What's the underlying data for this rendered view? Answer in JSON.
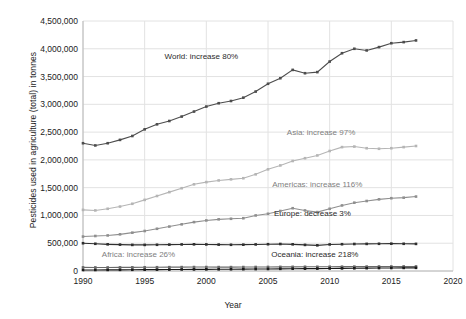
{
  "chart_data": {
    "type": "line",
    "title": "",
    "xlabel": "Year",
    "ylabel": "Pesticides used in agriculture (total) in tonnes",
    "xlim": [
      1990,
      2020
    ],
    "ylim": [
      0,
      4500000
    ],
    "grid": true,
    "legend_position": "inline-annotations",
    "x": [
      1990,
      1991,
      1992,
      1993,
      1994,
      1995,
      1996,
      1997,
      1998,
      1999,
      2000,
      2001,
      2002,
      2003,
      2004,
      2005,
      2006,
      2007,
      2008,
      2009,
      2010,
      2011,
      2012,
      2013,
      2014,
      2015,
      2016,
      2017
    ],
    "xticks": [
      "1990",
      "1995",
      "2000",
      "2005",
      "2010",
      "2015",
      "2020"
    ],
    "yticks": [
      "0",
      "500,000",
      "1,000,000",
      "1,500,000",
      "2,000,000",
      "2,500,000",
      "3,000,000",
      "3,500,000",
      "4,000,000",
      "4,500,000"
    ],
    "series": [
      {
        "name": "World",
        "annotation": "World: increase 80%",
        "color": "#4d4d4d",
        "annotation_x": 1999.6,
        "annotation_y": 3870000,
        "values": [
          2300000,
          2260000,
          2300000,
          2360000,
          2430000,
          2550000,
          2640000,
          2700000,
          2780000,
          2870000,
          2960000,
          3020000,
          3060000,
          3120000,
          3230000,
          3370000,
          3470000,
          3620000,
          3560000,
          3580000,
          3770000,
          3920000,
          4000000,
          3970000,
          4030000,
          4100000,
          4120000,
          4150000
        ]
      },
      {
        "name": "Asia",
        "annotation": "Asia: increase 97%",
        "color": "#b5b5b5",
        "annotation_x": 2009.3,
        "annotation_y": 2510000,
        "values": [
          1100000,
          1090000,
          1120000,
          1160000,
          1210000,
          1280000,
          1350000,
          1420000,
          1490000,
          1560000,
          1600000,
          1630000,
          1650000,
          1670000,
          1740000,
          1830000,
          1900000,
          1980000,
          2030000,
          2080000,
          2160000,
          2230000,
          2240000,
          2210000,
          2200000,
          2210000,
          2230000,
          2250000
        ]
      },
      {
        "name": "Americas",
        "annotation": "Americas: increase 116%",
        "color": "#8f8f8f",
        "annotation_x": 2009.0,
        "annotation_y": 1560000,
        "values": [
          620000,
          630000,
          640000,
          660000,
          690000,
          720000,
          760000,
          800000,
          840000,
          880000,
          910000,
          930000,
          940000,
          950000,
          1000000,
          1030000,
          1080000,
          1130000,
          1090000,
          1060000,
          1120000,
          1180000,
          1230000,
          1260000,
          1290000,
          1310000,
          1320000,
          1340000
        ]
      },
      {
        "name": "Europe",
        "annotation": "Europe: decrease 3%",
        "color": "#2e2e2e",
        "annotation_x": 2008.6,
        "annotation_y": 1050000,
        "values": [
          500000,
          490000,
          480000,
          475000,
          470000,
          470000,
          472000,
          475000,
          478000,
          480000,
          478000,
          475000,
          472000,
          474000,
          478000,
          482000,
          486000,
          480000,
          470000,
          462000,
          478000,
          482000,
          486000,
          488000,
          490000,
          492000,
          490000,
          488000
        ]
      },
      {
        "name": "Africa",
        "annotation": "Africa: increase 26%",
        "color": "#6a6a6a",
        "annotation_x": 1994.5,
        "annotation_y": 300000,
        "values": [
          65000,
          64000,
          64000,
          65000,
          66000,
          67000,
          68000,
          69000,
          70000,
          71000,
          71000,
          70000,
          70000,
          71000,
          72000,
          73000,
          74000,
          75000,
          76000,
          76000,
          77000,
          78000,
          79000,
          80000,
          81000,
          81000,
          82000,
          82000
        ]
      },
      {
        "name": "Oceania",
        "annotation": "Oceania: increase 218%",
        "color": "#1a1a1a",
        "annotation_x": 2008.8,
        "annotation_y": 310000,
        "values": [
          18000,
          19000,
          20000,
          21000,
          22000,
          24000,
          25000,
          26000,
          28000,
          29000,
          30000,
          31000,
          32000,
          33000,
          35000,
          37000,
          39000,
          41000,
          42000,
          43000,
          45000,
          47000,
          49000,
          51000,
          53000,
          55000,
          56000,
          57000
        ]
      }
    ]
  }
}
